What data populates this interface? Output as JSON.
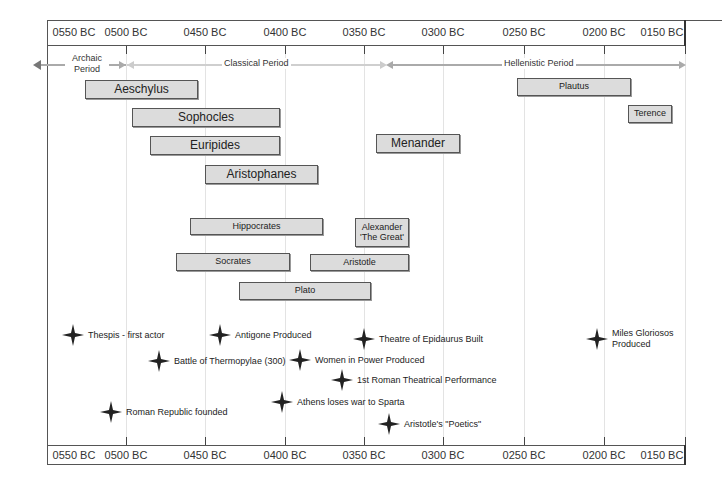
{
  "axis": {
    "ticks": [
      {
        "label": "0550 BC",
        "x": 74
      },
      {
        "label": "0500 BC",
        "x": 126
      },
      {
        "label": "0450 BC",
        "x": 205
      },
      {
        "label": "0400 BC",
        "x": 285
      },
      {
        "label": "0350 BC",
        "x": 364
      },
      {
        "label": "0300 BC",
        "x": 443
      },
      {
        "label": "0250 BC",
        "x": 524
      },
      {
        "label": "0200 BC",
        "x": 604
      },
      {
        "label": "0150 BC",
        "x": 662
      }
    ]
  },
  "periods": [
    {
      "label_line1": "Archaic",
      "label_line2": "Period",
      "start_x": 36,
      "end_x": 126
    },
    {
      "label_line1": "Classical Period",
      "start_x": 126,
      "end_x": 388
    },
    {
      "label_line1": "Hellenistic Period",
      "start_x": 388,
      "end_x": 686
    }
  ],
  "people": [
    {
      "name": "Aeschylus",
      "x": 85,
      "y": 80,
      "w": 113,
      "h": 19,
      "size": "big"
    },
    {
      "name": "Sophocles",
      "x": 132,
      "y": 108,
      "w": 148,
      "h": 19,
      "size": "big"
    },
    {
      "name": "Euripides",
      "x": 150,
      "y": 136,
      "w": 130,
      "h": 19,
      "size": "big"
    },
    {
      "name": "Aristophanes",
      "x": 205,
      "y": 165,
      "w": 113,
      "h": 19,
      "size": "big"
    },
    {
      "name": "Menander",
      "x": 376,
      "y": 134,
      "w": 84,
      "h": 19,
      "size": "big"
    },
    {
      "name": "Plautus",
      "x": 517,
      "y": 78,
      "w": 114,
      "h": 18,
      "size": "small"
    },
    {
      "name": "Terence",
      "x": 628,
      "y": 105,
      "w": 44,
      "h": 18,
      "size": "small"
    },
    {
      "name": "Hippocrates",
      "x": 190,
      "y": 218,
      "w": 133,
      "h": 17,
      "size": "small"
    },
    {
      "name": "Alexander 'The Great'",
      "x": 355,
      "y": 218,
      "w": 54,
      "h": 29,
      "size": "small"
    },
    {
      "name": "Socrates",
      "x": 176,
      "y": 253,
      "w": 114,
      "h": 18,
      "size": "small"
    },
    {
      "name": "Aristotle",
      "x": 310,
      "y": 254,
      "w": 99,
      "h": 17,
      "size": "small"
    },
    {
      "name": "Plato",
      "x": 239,
      "y": 282,
      "w": 132,
      "h": 18,
      "size": "small"
    }
  ],
  "events": [
    {
      "label": "Thespis - first actor",
      "x": 73,
      "y": 335
    },
    {
      "label": "Antigone Produced",
      "x": 220,
      "y": 335
    },
    {
      "label": "Theatre of Epidaurus Built",
      "x": 364,
      "y": 339
    },
    {
      "label": "Battle of Thermopylae (300)",
      "x": 159,
      "y": 361
    },
    {
      "label": "Women in Power Produced",
      "x": 300,
      "y": 360
    },
    {
      "label": "1st Roman Theatrical Performance",
      "x": 342,
      "y": 380
    },
    {
      "label": "Athens loses war to Sparta",
      "x": 282,
      "y": 402
    },
    {
      "label": "Roman Republic founded",
      "x": 111,
      "y": 412
    },
    {
      "label": "Aristotle's \"Poetics\"",
      "x": 389,
      "y": 424
    },
    {
      "label": "Miles Gloriosos Produced",
      "x": 597,
      "y": 339
    }
  ],
  "colors": {
    "bar_fill": "#dcdcdc",
    "bar_border": "#555555",
    "period_arrow": "#aaaaaa",
    "star": "#222222",
    "gridline": "#e3e3e3"
  }
}
